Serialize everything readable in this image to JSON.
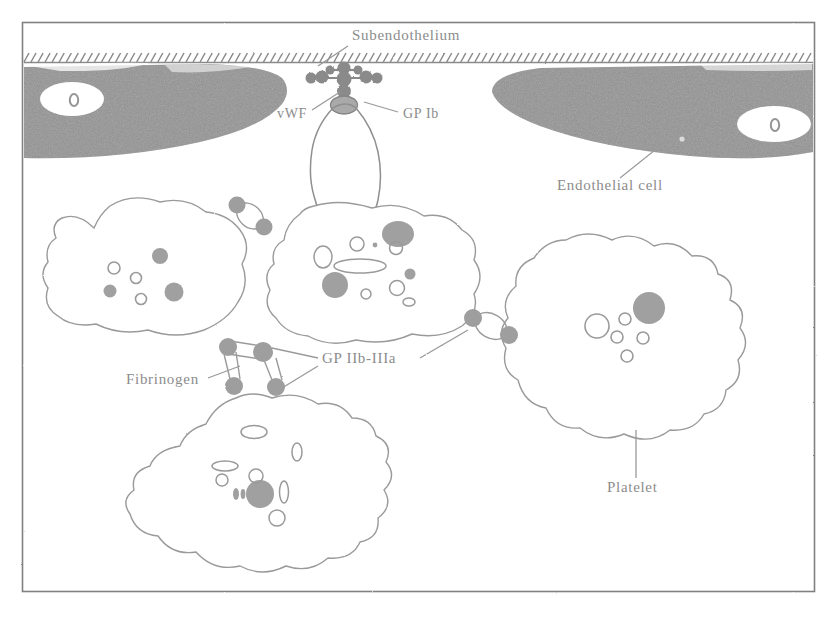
{
  "figure": {
    "frame": {
      "stroke_color": "#7a7a7a",
      "background": "#ffffff",
      "x": 22,
      "y": 22,
      "width": 793,
      "height": 570
    },
    "ink_color": "#8c8c8c",
    "fill_gray": "#8a8a8a",
    "cell_gray": "#8e8e8e",
    "label_color": "#8c8c8c"
  },
  "labels": [
    {
      "id": "subendothelium",
      "text": "Subendothelium",
      "x": 352,
      "y": 40,
      "anchor": "start",
      "leader": [
        [
          348,
          46
        ],
        [
          318,
          66
        ]
      ]
    },
    {
      "id": "vwf",
      "text": "vWF",
      "x": 277,
      "y": 118,
      "anchor": "start",
      "leader": [
        [
          312,
          110
        ],
        [
          340,
          92
        ]
      ]
    },
    {
      "id": "gp-ib",
      "text": "GP Ib",
      "x": 403,
      "y": 118,
      "anchor": "start",
      "leader": [
        [
          398,
          112
        ],
        [
          364,
          102
        ]
      ]
    },
    {
      "id": "endothelial-cell",
      "text": "Endothelial cell",
      "x": 557,
      "y": 190,
      "anchor": "start",
      "leader": [
        [
          620,
          178
        ],
        [
          655,
          150
        ]
      ]
    },
    {
      "id": "fibrinogen",
      "text": "Fibrinogen",
      "x": 126,
      "y": 384,
      "anchor": "start",
      "leader": [
        [
          208,
          378
        ],
        [
          240,
          366
        ]
      ]
    },
    {
      "id": "gp-iib-iiia",
      "text": "GP IIb-IIIa",
      "x": 322,
      "y": 363,
      "anchor": "start",
      "leader_list": [
        [
          [
            318,
            358
          ],
          [
            272,
            348
          ]
        ],
        [
          [
            318,
            366
          ],
          [
            282,
            388
          ]
        ],
        [
          [
            420,
            358
          ],
          [
            468,
            330
          ]
        ]
      ]
    },
    {
      "id": "platelet",
      "text": "Platelet",
      "x": 607,
      "y": 492,
      "anchor": "start",
      "leader": [
        [
          636,
          478
        ],
        [
          636,
          430
        ]
      ]
    }
  ],
  "structures": {
    "subendothelium_line": {
      "name": "subendothelium-hatched-line",
      "y": 62,
      "x_start": 24,
      "x_end": 813,
      "hatch_count": 112
    },
    "endothelial_cells": [
      {
        "id": "endothelial-cell-left",
        "nucleus": {
          "cx": 72,
          "cy": 99,
          "rx": 32,
          "ry": 17
        },
        "nucleolus": {
          "cx": 74,
          "cy": 100,
          "rx": 4,
          "ry": 6
        }
      },
      {
        "id": "endothelial-cell-right",
        "nucleus": {
          "cx": 774,
          "cy": 124,
          "rx": 37,
          "ry": 18
        },
        "nucleolus": {
          "cx": 775,
          "cy": 125,
          "rx": 4,
          "ry": 6
        }
      }
    ],
    "vwf_multimer": {
      "name": "vwf-multimer",
      "node_count": 9,
      "center": [
        344,
        82
      ]
    },
    "gp_ib_receptor": {
      "cx": 344,
      "cy": 104,
      "rx": 13,
      "ry": 9
    },
    "platelets": [
      {
        "id": "platelet-left",
        "granules_dense": 3,
        "granules_open": 3
      },
      {
        "id": "platelet-center",
        "granules_dense": 3,
        "granules_open": 7
      },
      {
        "id": "platelet-right",
        "granules_dense": 1,
        "granules_open": 5
      },
      {
        "id": "platelet-bottom",
        "granules_dense": 1,
        "granules_open": 8
      },
      {
        "id": "platelet-adherent",
        "granules_dense": 0,
        "granules_open": 0
      }
    ],
    "gp_iib_iiia_receptors": [
      {
        "cx": 237,
        "cy": 205
      },
      {
        "cx": 264,
        "cy": 226
      },
      {
        "cx": 228,
        "cy": 347
      },
      {
        "cx": 262,
        "cy": 352
      },
      {
        "cx": 233,
        "cy": 385
      },
      {
        "cx": 274,
        "cy": 387
      },
      {
        "cx": 473,
        "cy": 318
      },
      {
        "cx": 508,
        "cy": 334
      }
    ]
  }
}
